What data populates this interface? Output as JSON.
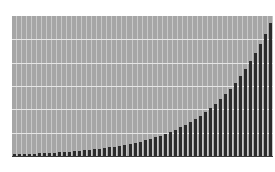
{
  "chart_data": {
    "type": "bar",
    "title": "",
    "xlabel": "",
    "ylabel": "",
    "ylim": [
      0,
      6
    ],
    "grid": true,
    "legend": null,
    "background_color": "#a6a6a6",
    "bar_color": "#2b2b2b",
    "categories": [
      1,
      2,
      3,
      4,
      5,
      6,
      7,
      8,
      9,
      10,
      11,
      12,
      13,
      14,
      15,
      16,
      17,
      18,
      19,
      20,
      21,
      22,
      23,
      24,
      25,
      26,
      27,
      28,
      29,
      30,
      31,
      32,
      33,
      34,
      35,
      36,
      37,
      38,
      39,
      40,
      41,
      42,
      43,
      44,
      45,
      46,
      47,
      48,
      49,
      50,
      51,
      52
    ],
    "values": [
      0.074,
      0.08,
      0.088,
      0.095,
      0.104,
      0.113,
      0.123,
      0.134,
      0.146,
      0.159,
      0.173,
      0.189,
      0.206,
      0.224,
      0.244,
      0.266,
      0.289,
      0.315,
      0.343,
      0.374,
      0.407,
      0.443,
      0.482,
      0.525,
      0.572,
      0.623,
      0.678,
      0.739,
      0.805,
      0.876,
      0.954,
      1.039,
      1.132,
      1.232,
      1.342,
      1.461,
      1.592,
      1.733,
      1.887,
      2.055,
      2.238,
      2.438,
      2.654,
      2.891,
      3.148,
      3.428,
      3.733,
      4.066,
      4.427,
      4.822,
      5.251,
      5.718
    ]
  }
}
